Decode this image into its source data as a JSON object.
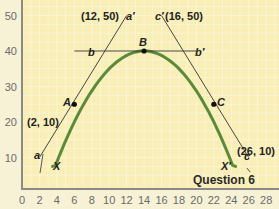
{
  "chart_data": {
    "type": "line",
    "title": "Question 6",
    "xlabel": "",
    "ylabel": "",
    "xlim": [
      0,
      28
    ],
    "ylim": [
      0,
      55
    ],
    "x_ticks": [
      "0",
      "2",
      "4",
      "6",
      "8",
      "10",
      "12",
      "14",
      "16",
      "18",
      "20",
      "22",
      "24",
      "26",
      "28"
    ],
    "y_ticks": [
      "10",
      "20",
      "30",
      "40",
      "50"
    ],
    "grid": true,
    "series": [
      {
        "name": "curve XX'",
        "color": "#5a8a3a",
        "x": [
          3.5,
          4,
          5,
          6,
          8,
          10,
          12,
          14,
          16,
          18,
          20,
          22,
          23,
          24,
          24.5
        ],
        "y": [
          8,
          13,
          19.5,
          25,
          32.5,
          37,
          39.3,
          40,
          39.3,
          37,
          32.5,
          25,
          19.5,
          13,
          8
        ]
      },
      {
        "name": "tangent aa'",
        "color": "#333333",
        "x": [
          2,
          12
        ],
        "y": [
          10,
          50
        ]
      },
      {
        "name": "tangent bb'",
        "color": "#333333",
        "x": [
          6,
          20
        ],
        "y": [
          40,
          40
        ]
      },
      {
        "name": "tangent cc'",
        "color": "#333333",
        "x": [
          16,
          26
        ],
        "y": [
          50,
          10
        ]
      }
    ],
    "points": [
      {
        "label": "A",
        "x": 6,
        "y": 25
      },
      {
        "label": "B",
        "x": 14,
        "y": 40
      },
      {
        "label": "C",
        "x": 22,
        "y": 25
      }
    ],
    "annotations": [
      "(12, 50)",
      "a'",
      "(16, 50)",
      "c'",
      "b",
      "b'",
      "(2, 10)",
      "a",
      "(26, 10)",
      "c",
      "X",
      "X'"
    ]
  },
  "labels": {
    "title": "Question 6",
    "ann_12_50": "(12, 50)",
    "ann_16_50": "(16, 50)",
    "ann_2_10": "(2, 10)",
    "ann_26_10": "(26, 10)",
    "a_prime": "a′",
    "a": "a",
    "b": "b",
    "b_prime": "b′",
    "c_prime": "c′",
    "c": "c",
    "A": "A",
    "B": "B",
    "C": "C",
    "X": "X",
    "X_prime": "X′"
  },
  "colors": {
    "background": "#f7f2d6",
    "plot_bg": "#f8eeb6",
    "grid": "#fbf6dc",
    "axis": "#8a8a8a",
    "curve": "#5a8a3a"
  }
}
